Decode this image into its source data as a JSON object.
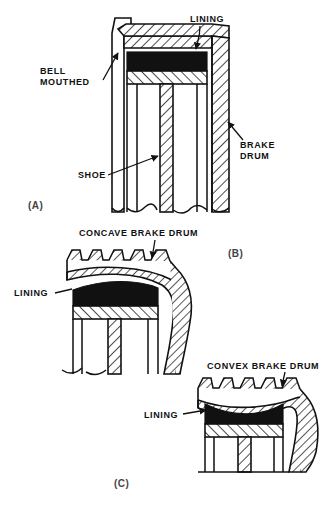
{
  "figure": {
    "colors": {
      "ink": "#111111",
      "lining_fill": "#111111",
      "metal_hatch": "#111111",
      "background": "#ffffff"
    },
    "panels": [
      {
        "id": "A",
        "key": "(A)",
        "condition": "bell mouthed",
        "labels": [
          {
            "name": "lining",
            "text": "LINING"
          },
          {
            "name": "bell-mouthed",
            "text_line1": "BELL",
            "text_line2": "MOUTHED"
          },
          {
            "name": "brake-drum",
            "text_line1": "BRAKE",
            "text_line2": "DRUM"
          },
          {
            "name": "shoe",
            "text": "SHOE"
          }
        ]
      },
      {
        "id": "B",
        "key": "(B)",
        "condition": "concave brake drum",
        "labels": [
          {
            "name": "concave-brake-drum",
            "text": "CONCAVE BRAKE DRUM"
          },
          {
            "name": "lining",
            "text": "LINING"
          }
        ]
      },
      {
        "id": "C",
        "key": "(C)",
        "condition": "convex brake drum",
        "labels": [
          {
            "name": "convex-brake-drum",
            "text": "CONVEX BRAKE DRUM"
          },
          {
            "name": "lining",
            "text": "LINING"
          }
        ]
      }
    ],
    "text": {
      "lining": "LINING",
      "bell_line1": "BELL",
      "bell_line2": "MOUTHED",
      "brake_line1": "BRAKE",
      "brake_line2": "DRUM",
      "shoe": "SHOE",
      "concave_brake_drum": "CONCAVE BRAKE DRUM",
      "convex_brake_drum": "CONVEX BRAKE DRUM",
      "key_a": "(A)",
      "key_b": "(B)",
      "key_c": "(C)"
    }
  }
}
